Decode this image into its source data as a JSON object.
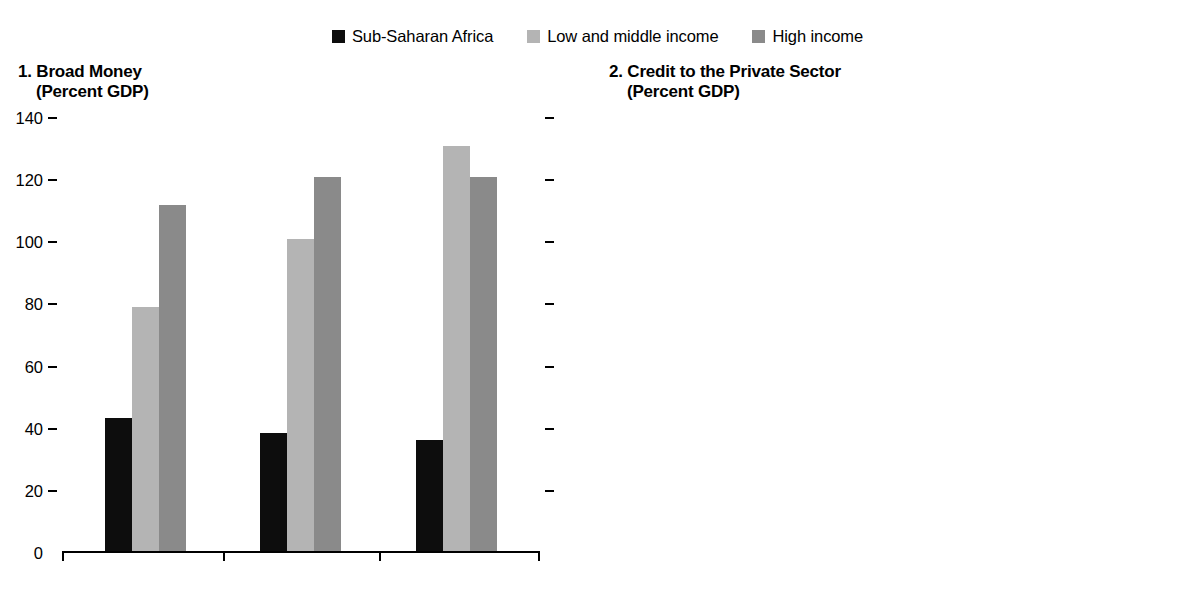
{
  "legend": {
    "items": [
      {
        "label": "Sub-Saharan Africa",
        "color": "#0d0d0d",
        "icon": "legend-swatch-icon"
      },
      {
        "label": "Low and middle income",
        "color": "#b4b4b4",
        "icon": "legend-swatch-icon"
      },
      {
        "label": "High income",
        "color": "#8a8a8a",
        "icon": "legend-swatch-icon"
      }
    ]
  },
  "panels": [
    {
      "number": "1.",
      "title": "1. Broad Money",
      "subtitle": "(Percent GDP)",
      "axis_side": "left",
      "tick_labels": [
        "140",
        "120",
        "100",
        "80",
        "60",
        "40",
        "20",
        "0"
      ],
      "opposite_ticks_only": true
    },
    {
      "number": "2.",
      "title": "2. Credit to the Private Sector",
      "subtitle": "(Percent GDP)",
      "axis_side": "right",
      "tick_labels": [
        "120",
        "100",
        "80",
        "60",
        "40",
        "20",
        "0"
      ],
      "opposite_ticks_only": true
    }
  ],
  "chart_data": [
    {
      "type": "bar",
      "title": "1. Broad Money",
      "subtitle": "(Percent GDP)",
      "xlabel": "",
      "ylabel": "(Percent GDP)",
      "ylim": [
        0,
        140
      ],
      "yticks": [
        0,
        20,
        40,
        60,
        80,
        100,
        120,
        140
      ],
      "axis_position": "left",
      "grid": false,
      "legend_position": "top-center",
      "categories": [
        "2008",
        "12",
        "16"
      ],
      "series": [
        {
          "name": "Sub-Saharan Africa",
          "color": "#0d0d0d",
          "values": [
            43,
            38,
            36
          ]
        },
        {
          "name": "Low and middle income",
          "color": "#b4b4b4",
          "values": [
            79,
            101,
            131
          ]
        },
        {
          "name": "High income",
          "color": "#8a8a8a",
          "values": [
            112,
            121,
            121
          ]
        }
      ]
    },
    {
      "type": "bar",
      "title": "2. Credit to the Private Sector",
      "subtitle": "(Percent GDP)",
      "xlabel": "",
      "ylabel": "(Percent GDP)",
      "ylim": [
        0,
        120
      ],
      "yticks": [
        0,
        20,
        40,
        60,
        80,
        100,
        120
      ],
      "axis_position": "right",
      "grid": false,
      "legend_position": "top-center",
      "categories": [
        "2008",
        "12",
        "16"
      ],
      "series": [
        {
          "name": "Sub-Saharan Africa",
          "color": "#0d0d0d",
          "values": [
            40,
            33,
            32
          ]
        },
        {
          "name": "Low and middle income",
          "color": "#b4b4b4",
          "values": [
            57,
            73,
            99
          ]
        },
        {
          "name": "High income",
          "color": "#8a8a8a",
          "values": [
            97,
            88,
            83
          ]
        }
      ]
    }
  ]
}
